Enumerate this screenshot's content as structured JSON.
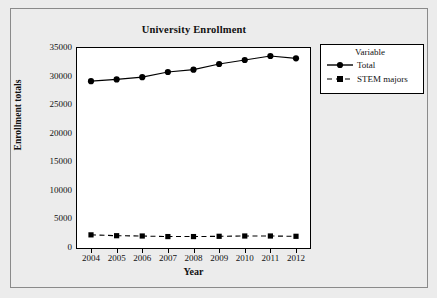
{
  "chart_data": {
    "type": "line",
    "title": "University Enrollment",
    "xlabel": "Year",
    "ylabel": "Enrollment totals",
    "categories": [
      "2004",
      "2005",
      "2006",
      "2007",
      "2008",
      "2009",
      "2010",
      "2011",
      "2012"
    ],
    "x": [
      2004,
      2005,
      2006,
      2007,
      2008,
      2009,
      2010,
      2011,
      2012
    ],
    "series": [
      {
        "name": "Total",
        "values": [
          29200,
          29500,
          29900,
          30800,
          31200,
          32200,
          32900,
          33600,
          33200
        ],
        "line_style": "solid",
        "marker": "filled-circle",
        "color": "#000000"
      },
      {
        "name": "STEM majors",
        "values": [
          2300,
          2150,
          2100,
          2000,
          2000,
          2050,
          2100,
          2100,
          2050
        ],
        "line_style": "dashed",
        "marker": "filled-square",
        "color": "#000000"
      }
    ],
    "ylim": [
      0,
      35000
    ],
    "y_ticks": [
      0,
      5000,
      10000,
      15000,
      20000,
      25000,
      30000,
      35000
    ],
    "y_tick_labels": [
      "0",
      "5000",
      "10000",
      "15000",
      "20000",
      "25000",
      "30000",
      "35000"
    ],
    "x_tick_labels": [
      "2004",
      "2005",
      "2006",
      "2007",
      "2008",
      "2009",
      "2010",
      "2011",
      "2012"
    ],
    "grid": false,
    "legend_position": "right-outside",
    "legend_title": "Variable"
  },
  "legend": {
    "title": "Variable",
    "entries": [
      {
        "label": "Total"
      },
      {
        "label": "STEM majors"
      }
    ]
  },
  "colors": {
    "figure_background": "#ececec",
    "plot_background": "#ffffff",
    "axis": "#000000",
    "series": "#000000",
    "outer_frame": "#8a8a8a"
  }
}
